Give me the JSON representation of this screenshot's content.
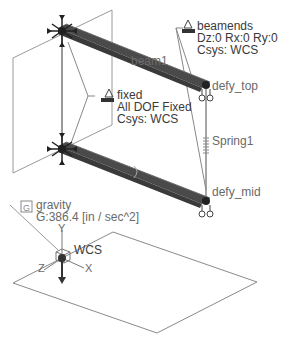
{
  "model": {
    "beam": {
      "name": "beam1"
    },
    "points": {
      "top": "defy_top",
      "mid": "defy_mid"
    },
    "spring": {
      "name": "Spring1"
    },
    "constraints": {
      "beamends": {
        "name": "beamends",
        "dofs": "Dz:0 Rx:0 Ry:0",
        "csys": "Csys: WCS"
      },
      "fixed": {
        "name": "fixed",
        "dofs": "All DOF Fixed",
        "csys": "Csys: WCS"
      }
    },
    "load": {
      "name": "gravity",
      "value": "G:386.4 [in / sec^2]",
      "icon": "G"
    },
    "csys": {
      "name": "WCS",
      "axes": {
        "x": "X",
        "y": "Y",
        "z": "Z"
      }
    }
  },
  "colors": {
    "beam": "#4a4a4a",
    "lines": "#8a8a8a",
    "text": "#3a3a3a",
    "spring": "#9a9a9a"
  }
}
